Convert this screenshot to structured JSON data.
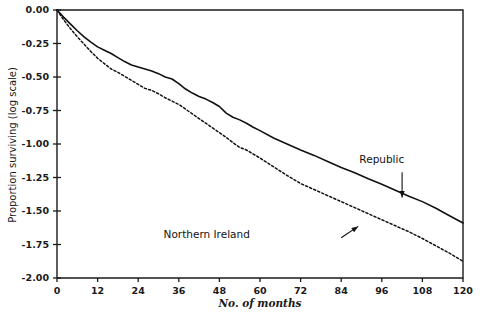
{
  "chart_data": {
    "type": "line",
    "title": "",
    "xlabel": "No. of months",
    "ylabel": "Proportion surviving (log scale)",
    "xlim": [
      0,
      120
    ],
    "ylim": [
      -2.0,
      0.0
    ],
    "xticks": [
      0,
      12,
      24,
      36,
      48,
      60,
      72,
      84,
      96,
      108,
      120
    ],
    "xtick_labels": [
      "0",
      "12",
      "24",
      "36",
      "48",
      "60",
      "72",
      "84",
      "96",
      "108",
      "120"
    ],
    "yticks": [
      0.0,
      -0.25,
      -0.5,
      -0.75,
      -1.0,
      -1.25,
      -1.5,
      -1.75,
      -2.0
    ],
    "ytick_labels": [
      "0.00",
      "-0.25",
      "-0.50",
      "-0.75",
      "-1.00",
      "-1.25",
      "-1.50",
      "-1.75",
      "-2.00"
    ],
    "grid": false,
    "legend_position": "inline-annotations",
    "series": [
      {
        "name": "Republic",
        "style": "solid",
        "color": "#111111",
        "x": [
          0,
          2,
          4,
          6,
          8,
          10,
          12,
          14,
          16,
          18,
          20,
          22,
          24,
          26,
          28,
          30,
          32,
          34,
          36,
          38,
          40,
          42,
          44,
          46,
          48,
          50,
          52,
          54,
          56,
          58,
          60,
          64,
          68,
          72,
          76,
          80,
          84,
          88,
          92,
          96,
          100,
          104,
          108,
          112,
          116,
          120
        ],
        "y": [
          0.0,
          -0.055,
          -0.105,
          -0.155,
          -0.2,
          -0.24,
          -0.275,
          -0.3,
          -0.325,
          -0.355,
          -0.385,
          -0.41,
          -0.425,
          -0.44,
          -0.455,
          -0.475,
          -0.5,
          -0.515,
          -0.55,
          -0.59,
          -0.62,
          -0.645,
          -0.665,
          -0.69,
          -0.72,
          -0.77,
          -0.8,
          -0.82,
          -0.845,
          -0.875,
          -0.9,
          -0.955,
          -1.0,
          -1.045,
          -1.085,
          -1.13,
          -1.175,
          -1.215,
          -1.26,
          -1.3,
          -1.345,
          -1.39,
          -1.43,
          -1.48,
          -1.535,
          -1.59
        ]
      },
      {
        "name": "Northern Ireland",
        "style": "dashed",
        "color": "#111111",
        "x": [
          0,
          2,
          4,
          6,
          8,
          10,
          12,
          14,
          16,
          18,
          20,
          22,
          24,
          26,
          28,
          30,
          32,
          34,
          36,
          38,
          40,
          42,
          44,
          46,
          48,
          50,
          52,
          54,
          56,
          58,
          60,
          64,
          68,
          72,
          76,
          80,
          84,
          88,
          92,
          96,
          100,
          104,
          108,
          112,
          116,
          120
        ],
        "y": [
          0.0,
          -0.075,
          -0.14,
          -0.2,
          -0.255,
          -0.31,
          -0.36,
          -0.4,
          -0.44,
          -0.465,
          -0.495,
          -0.525,
          -0.555,
          -0.585,
          -0.6,
          -0.625,
          -0.655,
          -0.68,
          -0.705,
          -0.74,
          -0.775,
          -0.81,
          -0.845,
          -0.88,
          -0.915,
          -0.95,
          -0.99,
          -1.025,
          -1.045,
          -1.075,
          -1.105,
          -1.17,
          -1.235,
          -1.295,
          -1.34,
          -1.385,
          -1.43,
          -1.475,
          -1.52,
          -1.565,
          -1.61,
          -1.655,
          -1.705,
          -1.76,
          -1.815,
          -1.875
        ]
      }
    ],
    "annotations": [
      {
        "name": "republic-annotation",
        "text": "Republic",
        "text_x": 96,
        "text_y": -1.14,
        "arrow_from_x": 102,
        "arrow_from_y": -1.21,
        "arrow_to_x": 102,
        "arrow_to_y": -1.4
      },
      {
        "name": "northern-ireland-annotation",
        "text": "Northern Ireland",
        "text_x": 57,
        "text_y": -1.7,
        "arrow_from_x": 84,
        "arrow_from_y": -1.7,
        "arrow_to_x": 89,
        "arrow_to_y": -1.615
      }
    ]
  }
}
